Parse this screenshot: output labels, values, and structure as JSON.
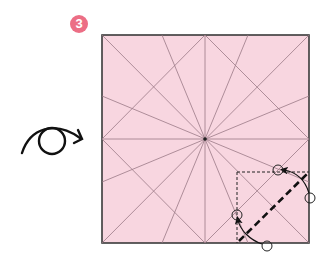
{
  "step": {
    "number": "3",
    "badge_color": "#ec6e85"
  },
  "instruction_icon": "flip-over-icon",
  "paper": {
    "fill": "#f8d6e0",
    "border": "#3a3a3a",
    "crease": "#9a7a86",
    "x": 102,
    "y": 35,
    "width": 207,
    "height": 208,
    "center": [
      205,
      139
    ]
  },
  "fold": {
    "type": "fold corner",
    "valley_line": "dashed diagonal across bottom-right corner",
    "guide_box": "dashed square at bottom-right corner",
    "reference_points": 4
  }
}
